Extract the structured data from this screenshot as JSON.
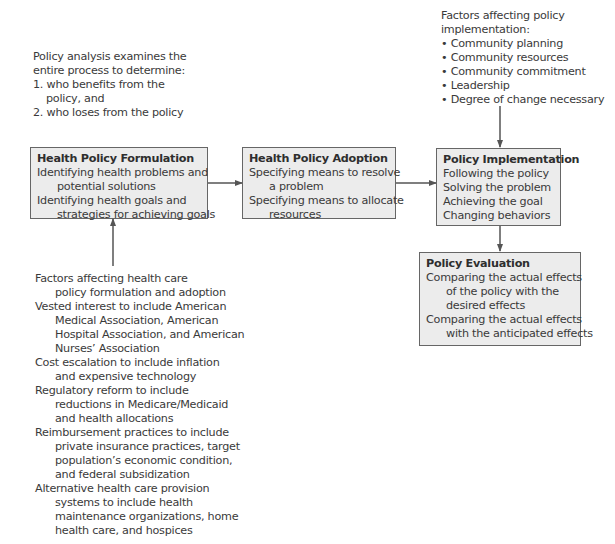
{
  "policy_analysis_note": {
    "lines": [
      "Policy analysis examines the",
      "entire process to determine:",
      "1. who benefits from the",
      "policy, and",
      "2. who loses from the policy"
    ]
  },
  "implementation_factors": {
    "heading_lines": [
      "Factors affecting policy",
      "implementation:"
    ],
    "bullet_symbol": "•",
    "items": [
      "Community planning",
      "Community resources",
      "Community commitment",
      "Leadership",
      "Degree of change necessary"
    ]
  },
  "boxes": {
    "formulation": {
      "title": "Health Policy Formulation",
      "lines": [
        "Identifying health problems and",
        "potential solutions",
        "Identifying health goals and",
        "strategies for achieving goals"
      ]
    },
    "adoption": {
      "title": "Health Policy Adoption",
      "lines": [
        "Specifying means to resolve",
        "a problem",
        "Specifying means to allocate",
        "resources"
      ]
    },
    "implementation": {
      "title": "Policy Implementation",
      "lines": [
        "Following the policy",
        "Solving the problem",
        "Achieving the goal",
        "Changing behaviors"
      ]
    },
    "evaluation": {
      "title": "Policy Evaluation",
      "lines": [
        "Comparing the actual effects",
        "of the policy with the",
        "desired effects",
        "Comparing the actual effects",
        "with the anticipated effects"
      ]
    }
  },
  "formulation_factors": {
    "lines": [
      "Factors affecting health care",
      "policy formulation and adoption",
      "Vested interest to include American",
      "Medical Association, American",
      "Hospital Association, and American",
      "Nurses’ Association",
      "Cost escalation to include inflation",
      "and expensive technology",
      "Regulatory reform to include",
      "reductions in Medicare/Medicaid",
      "and health allocations",
      "Reimbursement practices to include",
      "private insurance practices, target",
      "population’s economic condition,",
      "and federal subsidization",
      "Alternative health care provision",
      "systems to include health",
      "maintenance organizations, home",
      "health care, and hospices"
    ]
  },
  "colors": {
    "box_fill": "#ececec",
    "box_border": "#666666",
    "arrow": "#555555",
    "text": "#3a3a3a"
  }
}
